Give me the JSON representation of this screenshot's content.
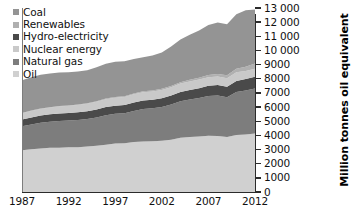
{
  "chart_data": {
    "type": "area",
    "stacked": true,
    "title": "",
    "xlabel": "",
    "ylabel": "Million tonnes oil equivalent",
    "x": [
      1987,
      1988,
      1989,
      1990,
      1991,
      1992,
      1993,
      1994,
      1995,
      1996,
      1997,
      1998,
      1999,
      2000,
      2001,
      2002,
      2003,
      2004,
      2005,
      2006,
      2007,
      2008,
      2009,
      2010,
      2011,
      2012
    ],
    "xlim": [
      1987,
      2012
    ],
    "ylim": [
      0,
      13000
    ],
    "ytick_step": 1000,
    "grid": false,
    "legend_position": "top-left",
    "xticks": [
      "1987",
      "1992",
      "1997",
      "2002",
      "2007",
      "2012"
    ],
    "xtick_values": [
      1987,
      1992,
      1997,
      2002,
      2007,
      2012
    ],
    "yticks": [
      "0",
      "1000",
      "2000",
      "3000",
      "4000",
      "5000",
      "6000",
      "7000",
      "8000",
      "9000",
      "10 000",
      "11 000",
      "12 000",
      "13 000"
    ],
    "ytick_values": [
      0,
      1000,
      2000,
      3000,
      4000,
      5000,
      6000,
      7000,
      8000,
      9000,
      10000,
      11000,
      12000,
      13000
    ],
    "stack_order_bottom_to_top": [
      "Oil",
      "Natural gas",
      "Hydro-electricity",
      "Nuclear energy",
      "Renewables",
      "Coal"
    ],
    "series": [
      {
        "name": "Oil",
        "color": "#d0d0d0",
        "values": [
          2950,
          3020,
          3080,
          3120,
          3130,
          3160,
          3160,
          3220,
          3270,
          3340,
          3430,
          3440,
          3530,
          3570,
          3590,
          3620,
          3700,
          3840,
          3890,
          3930,
          3970,
          3950,
          3890,
          4030,
          4070,
          4130
        ]
      },
      {
        "name": "Natural gas",
        "color": "#7d7d7d",
        "values": [
          1690,
          1750,
          1810,
          1850,
          1880,
          1890,
          1920,
          1930,
          1990,
          2080,
          2090,
          2120,
          2190,
          2290,
          2320,
          2390,
          2490,
          2570,
          2640,
          2710,
          2820,
          2870,
          2800,
          3030,
          3110,
          3190
        ]
      },
      {
        "name": "Hydro-electricity",
        "color": "#4a4a4a",
        "values": [
          490,
          500,
          510,
          520,
          530,
          530,
          550,
          550,
          570,
          580,
          580,
          590,
          600,
          610,
          600,
          610,
          620,
          650,
          670,
          690,
          710,
          740,
          750,
          790,
          800,
          830
        ]
      },
      {
        "name": "Nuclear energy",
        "color": "#c9c9c9",
        "values": [
          440,
          460,
          470,
          480,
          500,
          510,
          520,
          530,
          550,
          560,
          560,
          570,
          580,
          580,
          590,
          590,
          590,
          600,
          610,
          610,
          610,
          600,
          590,
          610,
          570,
          560
        ]
      },
      {
        "name": "Renewables",
        "color": "#b0b0b0",
        "values": [
          20,
          22,
          24,
          26,
          28,
          30,
          33,
          36,
          40,
          44,
          48,
          53,
          58,
          64,
          70,
          78,
          88,
          100,
          114,
          132,
          155,
          185,
          215,
          255,
          305,
          360
        ]
      },
      {
        "name": "Coal",
        "color": "#949494",
        "values": [
          2300,
          2360,
          2390,
          2380,
          2370,
          2340,
          2330,
          2340,
          2400,
          2460,
          2490,
          2460,
          2440,
          2400,
          2470,
          2560,
          2800,
          3010,
          3180,
          3340,
          3530,
          3630,
          3610,
          3840,
          3980,
          3820
        ]
      }
    ],
    "annotations": []
  },
  "legend": {
    "items": [
      {
        "label": "Coal",
        "color": "#949494"
      },
      {
        "label": "Renewables",
        "color": "#b0b0b0"
      },
      {
        "label": "Hydro-electricity",
        "color": "#4a4a4a"
      },
      {
        "label": "Nuclear energy",
        "color": "#c9c9c9"
      },
      {
        "label": "Natural gas",
        "color": "#7d7d7d"
      },
      {
        "label": "Oil",
        "color": "#d0d0d0"
      }
    ]
  },
  "axis": {
    "y_title": "Million tonnes oil equivalent",
    "y_labels": [
      "13 000",
      "12 000",
      "11 000",
      "10 000",
      "9000",
      "8000",
      "7000",
      "6000",
      "5000",
      "4000",
      "3000",
      "2000",
      "1000",
      "0"
    ],
    "x_labels": [
      "1987",
      "1992",
      "1997",
      "2002",
      "2007",
      "2012"
    ]
  },
  "colors": {
    "axis": "#2b2b2b",
    "text": "#111111",
    "background": "#ffffff"
  }
}
